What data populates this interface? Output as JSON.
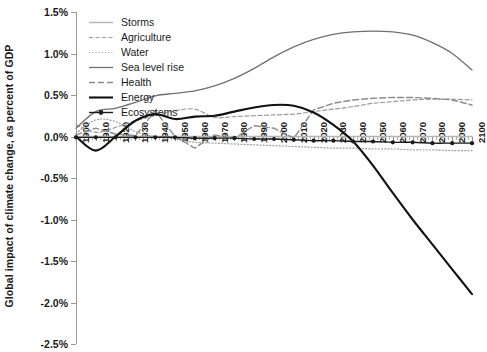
{
  "chart_data": {
    "type": "line",
    "title": "",
    "subtitle": "",
    "xlabel": "",
    "ylabel": "Global impact of climate change, as percent of GDP",
    "xlim": [
      1900,
      2100
    ],
    "ylim": [
      -2.5,
      1.5
    ],
    "yticks": [
      "1.5%",
      "1.0%",
      "0.5%",
      "0.0%",
      "-0.5%",
      "-1.0%",
      "-1.5%",
      "-2.0%",
      "-2.5%"
    ],
    "ytick_values": [
      1.5,
      1.0,
      0.5,
      0.0,
      -0.5,
      -1.0,
      -1.5,
      -2.0,
      -2.5
    ],
    "xticks": [
      "1900",
      "1910",
      "1920",
      "1930",
      "1940",
      "1950",
      "1960",
      "1970",
      "1980",
      "1990",
      "2000",
      "2010",
      "2020",
      "2030",
      "2040",
      "2050",
      "2060",
      "2070",
      "2080",
      "2090",
      "2100"
    ],
    "xtick_values": [
      1900,
      1910,
      1920,
      1930,
      1940,
      1950,
      1960,
      1970,
      1980,
      1990,
      2000,
      2010,
      2020,
      2030,
      2040,
      2050,
      2060,
      2070,
      2080,
      2090,
      2100
    ],
    "grid": false,
    "legend_position": "top-left",
    "units": "percent of GDP",
    "x": [
      1900,
      1910,
      1920,
      1930,
      1940,
      1950,
      1960,
      1970,
      1980,
      1990,
      2000,
      2010,
      2020,
      2030,
      2040,
      2050,
      2060,
      2070,
      2080,
      2090,
      2100
    ],
    "series": [
      {
        "name": "Storms",
        "color": "#b4b4b4",
        "dash": "solid",
        "marker": "none",
        "width": 1.4,
        "values": [
          0.0,
          0.0,
          0.0,
          0.0,
          0.0,
          0.0,
          0.0,
          0.0,
          0.0,
          0.0,
          0.0,
          0.0,
          0.0,
          0.0,
          0.0,
          0.0,
          0.0,
          0.0,
          0.0,
          0.0,
          0.0
        ]
      },
      {
        "name": "Agriculture",
        "color": "#9a9a9a",
        "dash": "dashed",
        "marker": "none",
        "width": 1.2,
        "values": [
          0.14,
          0.05,
          0.11,
          0.19,
          0.25,
          0.31,
          0.33,
          0.23,
          0.24,
          0.25,
          0.26,
          0.27,
          0.3,
          0.33,
          0.36,
          0.4,
          0.42,
          0.44,
          0.45,
          0.45,
          0.44
        ]
      },
      {
        "name": "Water",
        "color": "#9a9a9a",
        "dash": "dotted",
        "marker": "none",
        "width": 1.2,
        "values": [
          0.04,
          0.2,
          0.18,
          0.06,
          0.0,
          -0.03,
          -0.07,
          -0.08,
          -0.09,
          -0.1,
          -0.11,
          -0.12,
          -0.13,
          -0.14,
          -0.14,
          -0.15,
          -0.15,
          -0.16,
          -0.16,
          -0.17,
          -0.17
        ]
      },
      {
        "name": "Sea level rise",
        "color": "#707070",
        "dash": "solid",
        "marker": "none",
        "width": 1.3,
        "values": [
          0.1,
          0.3,
          0.34,
          0.41,
          0.49,
          0.52,
          0.55,
          0.61,
          0.7,
          0.82,
          0.96,
          1.08,
          1.17,
          1.23,
          1.26,
          1.27,
          1.26,
          1.22,
          1.13,
          1.0,
          0.8
        ]
      },
      {
        "name": "Health",
        "color": "#8c8c8c",
        "dash": "dashdot",
        "marker": "none",
        "width": 1.4,
        "values": [
          0.02,
          0.1,
          0.03,
          0.01,
          0.31,
          0.0,
          -0.14,
          0.02,
          -0.02,
          0.13,
          0.1,
          -0.02,
          0.32,
          0.4,
          0.44,
          0.46,
          0.47,
          0.47,
          0.46,
          0.44,
          0.38
        ]
      },
      {
        "name": "Energy",
        "color": "#111111",
        "dash": "solid",
        "marker": "none",
        "width": 2.1,
        "values": [
          0.0,
          -0.17,
          0.0,
          0.19,
          0.27,
          0.21,
          0.24,
          0.25,
          0.3,
          0.35,
          0.38,
          0.37,
          0.29,
          0.14,
          -0.06,
          -0.35,
          -0.68,
          -1.0,
          -1.3,
          -1.6,
          -1.9
        ]
      },
      {
        "name": "Ecosystems",
        "color": "#1a1a1a",
        "dash": "solid",
        "marker": "dot",
        "width": 1.4,
        "values": [
          -0.01,
          -0.01,
          -0.01,
          -0.01,
          -0.01,
          -0.01,
          -0.02,
          -0.02,
          -0.02,
          -0.03,
          -0.03,
          -0.04,
          -0.05,
          -0.05,
          -0.06,
          -0.06,
          -0.07,
          -0.07,
          -0.08,
          -0.08,
          -0.08
        ]
      }
    ]
  },
  "legend": {
    "items": [
      {
        "label": "Storms"
      },
      {
        "label": "Agriculture"
      },
      {
        "label": "Water"
      },
      {
        "label": "Sea level rise"
      },
      {
        "label": "Health"
      },
      {
        "label": "Energy"
      },
      {
        "label": "Ecosystems"
      }
    ]
  }
}
